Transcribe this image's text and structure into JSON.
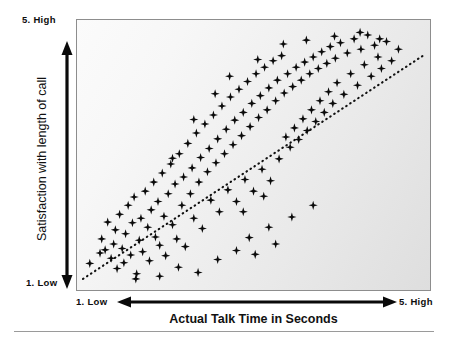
{
  "figure": {
    "background_color": "#ffffff",
    "plot_background_from": "#fbfbfb",
    "plot_background_to": "#dedede",
    "frame_color": "#8d8d8d",
    "marker_color": "#0a0a0a",
    "trendline_color": "#111111",
    "rule_color": "#9a9a9a"
  },
  "axes": {
    "y_title": "Satisfaction with length of call",
    "y_high_label": "5. High",
    "y_low_label": "1. Low",
    "x_title": "Actual Talk Time in Seconds",
    "x_low_label": "1. Low",
    "x_high_label": "5. High"
  },
  "chart_data": {
    "type": "scatter",
    "title": "",
    "subtitle": "",
    "xlabel": "Actual Talk Time in Seconds",
    "ylabel": "Satisfaction with length of call",
    "xlim": [
      1,
      5
    ],
    "ylim": [
      1,
      5
    ],
    "xtick_labels": [
      "1. Low",
      "5. High"
    ],
    "ytick_labels": [
      "1. Low",
      "5. High"
    ],
    "grid": false,
    "legend": null,
    "marker": "plus-star",
    "annotations": [],
    "trendline": {
      "type": "linear-dotted",
      "x": [
        1.0,
        5.0
      ],
      "y": [
        1.08,
        4.55
      ],
      "style": "dotted",
      "slope": 0.87,
      "intercept": 0.21
    },
    "points": [
      [
        1.08,
        1.32
      ],
      [
        1.2,
        1.48
      ],
      [
        1.22,
        1.7
      ],
      [
        1.26,
        1.53
      ],
      [
        1.29,
        1.96
      ],
      [
        1.33,
        1.4
      ],
      [
        1.36,
        1.62
      ],
      [
        1.38,
        1.84
      ],
      [
        1.4,
        1.24
      ],
      [
        1.43,
        2.08
      ],
      [
        1.46,
        1.55
      ],
      [
        1.48,
        1.33
      ],
      [
        1.5,
        1.78
      ],
      [
        1.53,
        2.22
      ],
      [
        1.56,
        1.45
      ],
      [
        1.58,
        1.95
      ],
      [
        1.6,
        2.35
      ],
      [
        1.63,
        1.16
      ],
      [
        1.66,
        1.68
      ],
      [
        1.68,
        2.02
      ],
      [
        1.7,
        1.5
      ],
      [
        1.73,
        2.44
      ],
      [
        1.76,
        1.88
      ],
      [
        1.78,
        1.36
      ],
      [
        1.8,
        2.15
      ],
      [
        1.83,
        2.58
      ],
      [
        1.85,
        1.73
      ],
      [
        1.88,
        2.28
      ],
      [
        1.9,
        1.6
      ],
      [
        1.93,
        2.72
      ],
      [
        1.95,
        2.05
      ],
      [
        1.97,
        1.44
      ],
      [
        2.0,
        2.4
      ],
      [
        2.03,
        2.86
      ],
      [
        2.05,
        1.92
      ],
      [
        2.08,
        2.55
      ],
      [
        2.1,
        1.7
      ],
      [
        2.13,
        3.02
      ],
      [
        2.16,
        2.22
      ],
      [
        2.18,
        2.66
      ],
      [
        2.2,
        1.58
      ],
      [
        2.23,
        3.18
      ],
      [
        2.26,
        2.4
      ],
      [
        2.28,
        2.8
      ],
      [
        2.3,
        2.02
      ],
      [
        2.33,
        3.34
      ],
      [
        2.36,
        2.58
      ],
      [
        2.38,
        2.96
      ],
      [
        2.4,
        1.86
      ],
      [
        2.43,
        3.48
      ],
      [
        2.46,
        2.74
      ],
      [
        2.48,
        3.1
      ],
      [
        2.5,
        2.3
      ],
      [
        2.53,
        3.62
      ],
      [
        2.56,
        2.88
      ],
      [
        2.58,
        3.25
      ],
      [
        2.6,
        2.12
      ],
      [
        2.63,
        3.76
      ],
      [
        2.66,
        3.02
      ],
      [
        2.68,
        3.4
      ],
      [
        2.7,
        2.46
      ],
      [
        2.73,
        3.9
      ],
      [
        2.76,
        3.16
      ],
      [
        2.78,
        3.54
      ],
      [
        2.8,
        2.28
      ],
      [
        2.83,
        4.02
      ],
      [
        2.86,
        3.3
      ],
      [
        2.88,
        3.66
      ],
      [
        2.9,
        2.62
      ],
      [
        2.93,
        4.14
      ],
      [
        2.96,
        3.44
      ],
      [
        2.98,
        3.8
      ],
      [
        3.0,
        2.44
      ],
      [
        3.03,
        4.26
      ],
      [
        3.06,
        3.58
      ],
      [
        3.08,
        3.92
      ],
      [
        3.1,
        2.78
      ],
      [
        3.13,
        4.36
      ],
      [
        3.16,
        3.7
      ],
      [
        3.18,
        4.04
      ],
      [
        3.2,
        2.6
      ],
      [
        3.23,
        4.46
      ],
      [
        3.26,
        3.84
      ],
      [
        3.28,
        4.16
      ],
      [
        3.3,
        2.94
      ],
      [
        3.33,
        4.54
      ],
      [
        3.36,
        3.96
      ],
      [
        3.38,
        3.28
      ],
      [
        3.4,
        4.26
      ],
      [
        3.43,
        3.12
      ],
      [
        3.46,
        4.06
      ],
      [
        3.48,
        3.42
      ],
      [
        3.5,
        4.36
      ],
      [
        3.53,
        3.24
      ],
      [
        3.56,
        4.16
      ],
      [
        3.58,
        3.56
      ],
      [
        3.6,
        4.44
      ],
      [
        3.63,
        3.38
      ],
      [
        3.66,
        4.26
      ],
      [
        3.68,
        3.7
      ],
      [
        3.7,
        4.52
      ],
      [
        3.73,
        3.52
      ],
      [
        3.76,
        4.34
      ],
      [
        3.78,
        3.84
      ],
      [
        3.8,
        4.6
      ],
      [
        3.83,
        3.66
      ],
      [
        3.86,
        4.42
      ],
      [
        3.88,
        3.98
      ],
      [
        3.9,
        4.68
      ],
      [
        3.93,
        3.8
      ],
      [
        3.96,
        4.5
      ],
      [
        3.98,
        4.12
      ],
      [
        4.02,
        4.74
      ],
      [
        4.06,
        3.94
      ],
      [
        4.1,
        4.58
      ],
      [
        4.14,
        4.26
      ],
      [
        4.18,
        4.8
      ],
      [
        4.22,
        4.08
      ],
      [
        4.26,
        4.64
      ],
      [
        4.3,
        4.4
      ],
      [
        4.34,
        4.86
      ],
      [
        4.38,
        4.22
      ],
      [
        4.42,
        4.7
      ],
      [
        4.46,
        4.52
      ],
      [
        4.5,
        4.34
      ],
      [
        4.56,
        4.76
      ],
      [
        4.62,
        4.46
      ],
      [
        4.7,
        4.64
      ],
      [
        1.62,
        1.08
      ],
      [
        1.9,
        1.12
      ],
      [
        2.12,
        1.26
      ],
      [
        2.35,
        1.18
      ],
      [
        2.58,
        1.38
      ],
      [
        2.8,
        1.52
      ],
      [
        3.02,
        1.46
      ],
      [
        3.26,
        1.62
      ],
      [
        2.05,
        2.95
      ],
      [
        2.3,
        3.55
      ],
      [
        2.55,
        3.95
      ],
      [
        2.72,
        4.22
      ],
      [
        3.05,
        4.48
      ],
      [
        3.35,
        4.72
      ],
      [
        3.62,
        4.78
      ],
      [
        3.95,
        4.84
      ],
      [
        4.25,
        4.9
      ],
      [
        4.48,
        4.8
      ],
      [
        2.95,
        1.72
      ],
      [
        3.18,
        1.88
      ],
      [
        3.45,
        2.04
      ],
      [
        3.7,
        2.22
      ],
      [
        2.88,
        2.12
      ],
      [
        3.12,
        2.36
      ]
    ]
  }
}
